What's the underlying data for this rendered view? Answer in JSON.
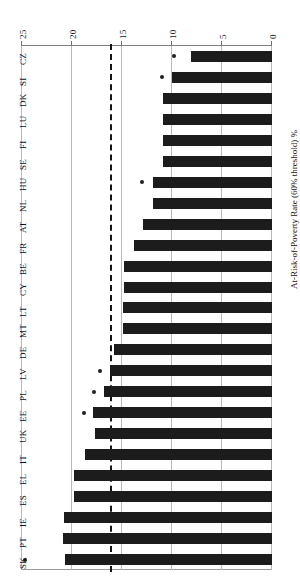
{
  "chart_data": {
    "type": "bar",
    "orientation": "horizontal",
    "title": "",
    "xlabel": "At-Risk-of-Poverty Rate (60% threshold) %",
    "ylabel": "",
    "xlim": [
      0,
      25
    ],
    "xticks": [
      0,
      5,
      10,
      15,
      20,
      25
    ],
    "xticklabels": [
      "0",
      "5",
      "10",
      "15",
      "20",
      "25"
    ],
    "grid": true,
    "legend": "none",
    "categories": [
      "SK",
      "PT",
      "IE",
      "ES",
      "EL",
      "IT",
      "UK",
      "EE",
      "PL",
      "LV",
      "DE",
      "MT",
      "LT",
      "CY",
      "BE",
      "FR",
      "AT",
      "NL",
      "HU",
      "SE",
      "FI",
      "LU",
      "DK",
      "SI",
      "CZ"
    ],
    "values": [
      20.7,
      20.9,
      20.8,
      19.8,
      19.8,
      18.7,
      17.7,
      17.9,
      16.8,
      16.2,
      15.8,
      14.9,
      14.9,
      14.8,
      14.8,
      13.8,
      12.9,
      11.9,
      11.9,
      10.9,
      10.9,
      10.9,
      10.9,
      10.0,
      8.1
    ],
    "reference_line": {
      "value": 16.0,
      "style": "dashed",
      "label": ""
    },
    "markers": {
      "symbol": "asterisk",
      "categories": [
        "SK",
        "EE",
        "PL",
        "LV",
        "HU",
        "SI",
        "CZ"
      ],
      "values": [
        24.7,
        18.8,
        17.8,
        17.2,
        13.0,
        11.0,
        9.8
      ]
    }
  }
}
